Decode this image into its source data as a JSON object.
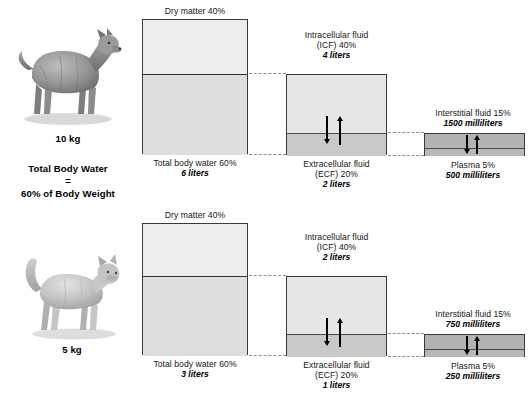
{
  "diagram": {
    "title_block": {
      "line1": "Total Body Water",
      "line2": "=",
      "line3": "60% of Body Weight"
    },
    "rows": [
      {
        "animal": "dog",
        "animal_icon": "dog-silhouette",
        "weight": "10 kg",
        "whole_body": {
          "top_label": "Dry matter 40%",
          "bottom_label": "Total body water 60%",
          "bottom_value": "6 liters"
        },
        "body_water": {
          "top_label_line1": "Intracellular fluid",
          "top_label_line2": "(ICF) 40%",
          "top_value": "4 liters",
          "bottom_label_line1": "Extracellular fluid",
          "bottom_label_line2": "(ECF) 20%",
          "bottom_value": "2 liters"
        },
        "ecf_split": {
          "top_label": "Interstitial fluid 15%",
          "top_value": "1500 milliliters",
          "bottom_label": "Plasma 5%",
          "bottom_value": "500 milliliters"
        }
      },
      {
        "animal": "cat",
        "animal_icon": "cat-silhouette",
        "weight": "5 kg",
        "whole_body": {
          "top_label": "Dry matter 40%",
          "bottom_label": "Total body water 60%",
          "bottom_value": "3 liters"
        },
        "body_water": {
          "top_label_line1": "Intracellular fluid",
          "top_label_line2": "(ICF) 40%",
          "top_value": "2 liters",
          "bottom_label_line1": "Extracellular fluid",
          "bottom_label_line2": "(ECF) 20%",
          "bottom_value": "1 liters"
        },
        "ecf_split": {
          "top_label": "Interstitial fluid 15%",
          "top_value": "750 milliliters",
          "bottom_label": "Plasma 5%",
          "bottom_value": "250 milliliters"
        }
      }
    ],
    "colors": {
      "dry_matter": "#ededed",
      "total_body_water": "#dedede",
      "icf": "#e6e6e6",
      "ecf": "#c9c9c9",
      "interstitial": "#b2b2b2",
      "plasma": "#b8b8b8",
      "outline": "#3a3a3a",
      "leader": "#8d8d8d"
    }
  }
}
